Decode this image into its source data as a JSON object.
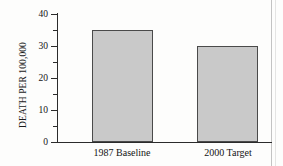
{
  "chart_data": {
    "type": "bar",
    "title": "",
    "xlabel": "",
    "ylabel": "DEATH PER 100,000",
    "categories": [
      "1987 Baseline",
      "2000 Target"
    ],
    "values": [
      35,
      30
    ],
    "ylim": [
      0,
      40
    ],
    "yticks": [
      0,
      10,
      20,
      30,
      40
    ],
    "ytick_labels": [
      "0",
      "10",
      "20",
      "30",
      "40"
    ],
    "minor_yticks": [
      5,
      15,
      25,
      35
    ],
    "grid": false,
    "legend": null,
    "bar_color": "#c9c9c9",
    "bar_edge_color": "#4a4a4a",
    "axis_color": "#2b2b2b"
  },
  "axis": {
    "y_title": "DEATH PER 100,000",
    "labels": {
      "t0": "0",
      "t10": "10",
      "t20": "20",
      "t30": "30",
      "t40": "40"
    }
  },
  "categories": {
    "first": "1987 Baseline",
    "second": "2000 Target"
  }
}
